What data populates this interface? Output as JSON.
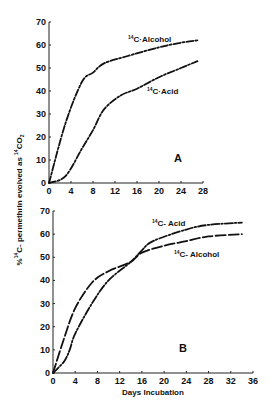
{
  "figure": {
    "ylabel": "% ¹⁴C- permethrin evolved as ¹⁴CO₂",
    "ylabel_parts": {
      "pct": "%",
      "sup14": "14",
      "main": "C- permethrin evolved as ",
      "sup14b": "14",
      "co": "CO",
      "sub2": "2"
    },
    "xlabel": "Days Incubation"
  },
  "chart_data": [
    {
      "type": "line",
      "panel_label": "A",
      "xlabel": "",
      "ylabel": "% ¹⁴C- permethrin evolved as ¹⁴CO₂",
      "xlim": [
        0,
        28
      ],
      "ylim": [
        0,
        70
      ],
      "xticks": [
        0,
        4,
        8,
        12,
        16,
        20,
        24,
        28
      ],
      "yticks": [
        0,
        10,
        20,
        30,
        40,
        50,
        60,
        70
      ],
      "grid": false,
      "series": [
        {
          "name": "¹⁴C·Alcohol",
          "label_sup": "14",
          "label_text": "C·Alcohol",
          "dash": "long-short",
          "x": [
            0,
            3,
            6,
            8,
            10,
            14,
            20,
            24,
            27
          ],
          "y": [
            0,
            26,
            44,
            48,
            52,
            55,
            59,
            61,
            62
          ]
        },
        {
          "name": "¹⁴C·Acid",
          "label_sup": "14",
          "label_text": "C·Acid",
          "dash": "long-short",
          "x": [
            0,
            3,
            6,
            8,
            10,
            13,
            16,
            20,
            24,
            27
          ],
          "y": [
            0,
            3,
            15,
            23,
            32,
            38,
            41,
            46,
            50,
            53
          ]
        }
      ]
    },
    {
      "type": "line",
      "panel_label": "B",
      "xlabel": "Days Incubation",
      "ylabel": "% ¹⁴C- permethrin evolved as ¹⁴CO₂",
      "xlim": [
        0,
        36
      ],
      "ylim": [
        0,
        70
      ],
      "xticks": [
        0,
        4,
        8,
        12,
        16,
        20,
        24,
        28,
        32,
        36
      ],
      "yticks": [
        0,
        10,
        20,
        30,
        40,
        50,
        60,
        70
      ],
      "grid": false,
      "series": [
        {
          "name": "¹⁴C- Acid",
          "label_sup": "14",
          "label_text": "C- Acid",
          "dash": "dash-dot",
          "x": [
            0,
            2,
            3,
            4,
            7,
            10,
            14,
            16,
            18,
            24,
            28,
            34
          ],
          "y": [
            0,
            5,
            10,
            17,
            30,
            40,
            48,
            53,
            57,
            62,
            64,
            65
          ]
        },
        {
          "name": "¹⁴C- Alcohol",
          "label_sup": "14",
          "label_text": "C- Alcohol",
          "dash": "long-dash",
          "x": [
            0,
            2,
            4,
            7,
            10,
            14,
            16,
            20,
            24,
            28,
            34
          ],
          "y": [
            0,
            15,
            28,
            39,
            44,
            48,
            52,
            55,
            57,
            59,
            60
          ]
        }
      ]
    }
  ]
}
